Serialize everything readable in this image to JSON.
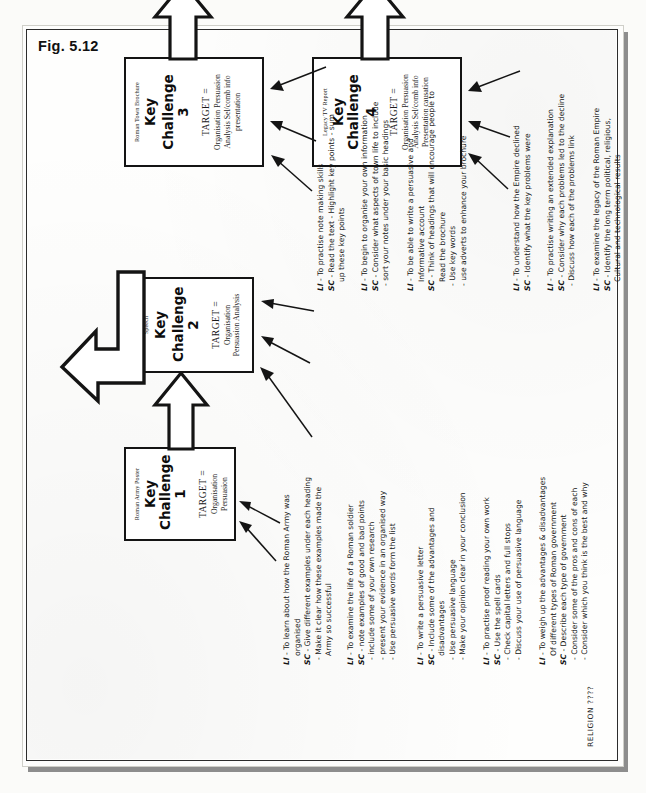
{
  "figure": {
    "label": "Fig. 5.12",
    "footer_note": "RELIGION ????"
  },
  "challenges": [
    {
      "id": "key-challenge-1",
      "source": "Roman Army Poster",
      "title": "Key Challenge",
      "number": "1",
      "target_label": "TARGET =",
      "targets": [
        "Organisation",
        "Persuasion"
      ]
    },
    {
      "id": "key-challenge-2",
      "source": "Roman Govn.\nElection Speech",
      "source_line1": "Roman Govn.",
      "source_line2": "Election Speech",
      "title": "Key",
      "title2": "Challenge 2",
      "number": "",
      "target_label": "TARGET =",
      "targets": [
        "Organisation",
        "Persuasion",
        "Analysis"
      ]
    },
    {
      "id": "key-challenge-3",
      "source_line1": "Roman Town",
      "source_line2": "Brochure",
      "title": "Key",
      "title2": "Challenge 3",
      "number": "",
      "target_label": "TARGET =",
      "targets": [
        "Organisation",
        "Persuasion",
        "Analysis",
        "Sel/comb info",
        "presentation"
      ]
    },
    {
      "id": "key-challenge-4",
      "source_line1": "Legacy TV Report",
      "source_line2": "",
      "title": "Key Challenge",
      "title2": "4",
      "number": "",
      "target_label": "TARGET =",
      "targets": [
        "Organisation",
        "Persuasion",
        "Analysis",
        "Sel/comb info",
        "Presentation",
        "causation"
      ]
    }
  ],
  "annotations": [
    {
      "id": "ann-1",
      "belongs_to": "key-challenge-1",
      "lines": [
        {
          "label": "LI",
          "text": "- To learn about how the Roman Army was",
          "style": "head"
        },
        {
          "label": "",
          "text": "organised",
          "style": "cont"
        },
        {
          "label": "SC",
          "text": "- Give different examples under each heading",
          "style": "head"
        },
        {
          "label": "",
          "text": "- Make it clear how these examples made the",
          "style": "sub"
        },
        {
          "label": "",
          "text": "Army so successful",
          "style": "cont"
        }
      ]
    },
    {
      "id": "ann-2",
      "belongs_to": "key-challenge-1",
      "lines": [
        {
          "label": "LI",
          "text": "- To examine the life of a Roman soldier",
          "style": "head"
        },
        {
          "label": "SC",
          "text": "- note examples of good and bad points",
          "style": "head"
        },
        {
          "label": "",
          "text": "- include some of your own research",
          "style": "sub"
        },
        {
          "label": "",
          "text": "- present your evidence in an organised way",
          "style": "sub"
        },
        {
          "label": "",
          "text": "- Use persuasive words form the list",
          "style": "sub"
        }
      ]
    },
    {
      "id": "ann-3",
      "belongs_to": "key-challenge-2",
      "lines": [
        {
          "label": "LI",
          "text": "- To write a persuasive letter",
          "style": "head"
        },
        {
          "label": "SC",
          "text": "- Include some of the advantages and",
          "style": "head"
        },
        {
          "label": "",
          "text": "disadvantages",
          "style": "cont"
        },
        {
          "label": "",
          "text": "- Use persuasive language",
          "style": "sub"
        },
        {
          "label": "",
          "text": "- Make your opinion clear in your conclusion",
          "style": "sub"
        }
      ]
    },
    {
      "id": "ann-4",
      "belongs_to": "key-challenge-2",
      "lines": [
        {
          "label": "LI",
          "text": "- To practise proof reading your own work",
          "style": "head"
        },
        {
          "label": "SC",
          "text": "- Use the spell cards",
          "style": "head"
        },
        {
          "label": "",
          "text": "- Check capital letters and full stops",
          "style": "sub"
        },
        {
          "label": "",
          "text": "- Discuss your use of persuasive language",
          "style": "sub"
        }
      ]
    },
    {
      "id": "ann-5",
      "belongs_to": "key-challenge-2",
      "lines": [
        {
          "label": "LI",
          "text": "- To weigh up the advantages & disadvantages",
          "style": "head"
        },
        {
          "label": "",
          "text": "Of different types of Roman government",
          "style": "cont"
        },
        {
          "label": "SC",
          "text": "- Describe each type of government",
          "style": "head"
        },
        {
          "label": "",
          "text": "- Consider some of the pros and cons of each",
          "style": "sub"
        },
        {
          "label": "",
          "text": "- Consider which you think is the best and why",
          "style": "sub"
        }
      ]
    },
    {
      "id": "ann-6",
      "belongs_to": "key-challenge-3",
      "lines": [
        {
          "label": "LI",
          "text": "- To practise note making skills",
          "style": "head"
        },
        {
          "label": "SC",
          "text": "- Read the text - Highlight key points - sum",
          "style": "head"
        },
        {
          "label": "",
          "text": "up these key points",
          "style": "cont"
        }
      ]
    },
    {
      "id": "ann-7",
      "belongs_to": "key-challenge-3",
      "lines": [
        {
          "label": "LI",
          "text": "- To begin to organise your own information",
          "style": "head"
        },
        {
          "label": "SC",
          "text": "- Consider what aspects of town life to include",
          "style": "head"
        },
        {
          "label": "",
          "text": "- sort your notes under your basic headings",
          "style": "sub"
        }
      ]
    },
    {
      "id": "ann-8",
      "belongs_to": "key-challenge-3",
      "lines": [
        {
          "label": "LI",
          "text": "- To be able to write a persuasive and",
          "style": "head"
        },
        {
          "label": "",
          "text": "Informative account",
          "style": "cont"
        },
        {
          "label": "SC",
          "text": "- Think of headings that will encourage people to",
          "style": "head"
        },
        {
          "label": "",
          "text": "Read the brochure",
          "style": "cont"
        },
        {
          "label": "",
          "text": "- Use key words",
          "style": "sub"
        },
        {
          "label": "",
          "text": "- use adverts to enhance your brochure",
          "style": "sub"
        }
      ]
    },
    {
      "id": "ann-9",
      "belongs_to": "key-challenge-4",
      "lines": [
        {
          "label": "LI",
          "text": "- To understand how the Empire declined",
          "style": "head"
        },
        {
          "label": "SC",
          "text": "- Identify what the key problems were",
          "style": "head"
        }
      ]
    },
    {
      "id": "ann-10",
      "belongs_to": "key-challenge-4",
      "lines": [
        {
          "label": "LI",
          "text": "- To practise writing an extended explanation",
          "style": "head"
        },
        {
          "label": "SC",
          "text": "- Consider why each problems led to the decline",
          "style": "head"
        },
        {
          "label": "",
          "text": "- Discuss how each of the problems link",
          "style": "sub"
        }
      ]
    },
    {
      "id": "ann-11",
      "belongs_to": "key-challenge-4",
      "lines": [
        {
          "label": "LI",
          "text": "- To examine the legacy of the Roman Empire",
          "style": "head"
        },
        {
          "label": "SC",
          "text": "- Identify the long term political, religious,",
          "style": "head"
        },
        {
          "label": "",
          "text": "Cultural and technological results",
          "style": "cont"
        }
      ]
    }
  ],
  "flow_arrows": [
    {
      "id": "arrow-1-to-2",
      "from": "key-challenge-1",
      "to": "key-challenge-2",
      "style": "block-outline"
    },
    {
      "id": "arrow-2-to-3",
      "from": "key-challenge-2",
      "to": "key-challenge-3",
      "style": "block-outline-bent"
    },
    {
      "id": "arrow-3-to-4",
      "from": "key-challenge-3",
      "to": "key-challenge-4",
      "style": "block-outline"
    },
    {
      "id": "arrow-4-out",
      "from": "key-challenge-4",
      "to": "",
      "style": "block-outline"
    }
  ],
  "colors": {
    "ink": "#141414",
    "paper": "#fdfdfc",
    "page_shadow": "#8d8d8d",
    "frame": "#2c2c2c"
  }
}
